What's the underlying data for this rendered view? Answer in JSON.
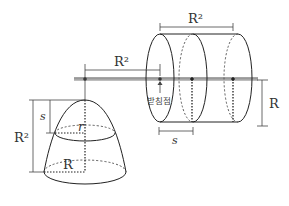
{
  "diagram": {
    "type": "physics/geometry lever diagram",
    "colors": {
      "line": "#222222",
      "rod": "#9a9a9a",
      "dim": "#555555",
      "text": "#333333"
    },
    "labels": {
      "lever_arm_length": "R²",
      "cylinder_length": "R²",
      "cylinder_radius": "R",
      "slice_thickness": "s",
      "fulcrum": "받침점",
      "cone_height": "R²",
      "cone_depth_s": "s",
      "cone_slice_radius": "r",
      "cone_base_radius": "R"
    },
    "parts": [
      {
        "name": "lever-rod",
        "description": "horizontal rod balanced on a fulcrum"
      },
      {
        "name": "paraboloid-solid",
        "description": "solid hanging from left end of rod with cross-section at depth s of radius r and base radius R, height R²"
      },
      {
        "name": "cylinder",
        "description": "horizontal cylinder of length R² and radius R threaded on the rod, with slices of thickness s"
      }
    ]
  }
}
